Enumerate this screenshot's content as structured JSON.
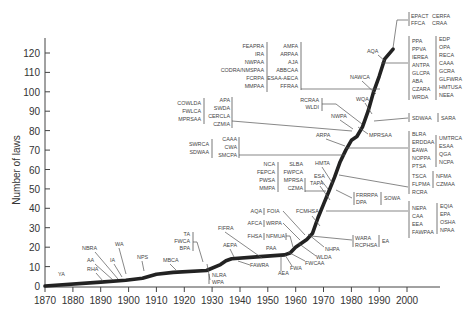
{
  "chart_data": {
    "type": "line",
    "title": "",
    "xlabel": "",
    "ylabel": "Number of laws",
    "xlim": [
      1870,
      2005
    ],
    "ylim": [
      0,
      125
    ],
    "x_ticks": [
      1870,
      1880,
      1890,
      1900,
      1910,
      1920,
      1930,
      1940,
      1950,
      1960,
      1970,
      1980,
      1990,
      2000
    ],
    "y_ticks": [
      0,
      10,
      20,
      30,
      40,
      50,
      60,
      70,
      80,
      90,
      100,
      110,
      120
    ],
    "grid": false,
    "legend": null,
    "series": [
      {
        "name": "Cumulative number of laws",
        "x": [
          1870,
          1890,
          1899,
          1905,
          1910,
          1916,
          1928,
          1933,
          1935,
          1937,
          1946,
          1956,
          1958,
          1960,
          1964,
          1966,
          1968,
          1970,
          1972,
          1974,
          1976,
          1978,
          1980,
          1982,
          1984,
          1986,
          1988,
          1990,
          1992,
          1995
        ],
        "values": [
          0,
          2,
          3,
          4,
          6,
          7,
          8,
          11,
          13,
          14,
          15,
          16,
          17,
          20,
          24,
          27,
          35,
          42,
          49,
          56,
          64,
          70,
          75,
          77,
          82,
          90,
          100,
          108,
          117,
          122
        ]
      }
    ],
    "annotations": [
      {
        "labels": [
          "YA"
        ]
      },
      {
        "labels": [
          "RHA"
        ]
      },
      {
        "labels": [
          "AA"
        ]
      },
      {
        "labels": [
          "NBRA"
        ]
      },
      {
        "labels": [
          "IA"
        ]
      },
      {
        "labels": [
          "WA"
        ]
      },
      {
        "labels": [
          "NPS"
        ]
      },
      {
        "labels": [
          "MBCA"
        ]
      },
      {
        "labels": [
          "TA",
          "FWCA",
          "BPA"
        ]
      },
      {
        "labels": [
          "NLRA",
          "WPA"
        ]
      },
      {
        "labels": [
          "FIFRA"
        ]
      },
      {
        "labels": [
          "AEPA"
        ]
      },
      {
        "labels": [
          "FAWRA"
        ]
      },
      {
        "labels": [
          "AEA"
        ]
      },
      {
        "labels": [
          "FWA"
        ]
      },
      {
        "labels": [
          "PAA"
        ]
      },
      {
        "labels": [
          "FWCAA"
        ]
      },
      {
        "labels": [
          "FHSA",
          "NFMUA"
        ]
      },
      {
        "labels": [
          "WLDA"
        ]
      },
      {
        "labels": [
          "AFCA",
          "WRPA"
        ]
      },
      {
        "labels": [
          "NHPA"
        ]
      },
      {
        "labels": [
          "AQA",
          "FOIA"
        ]
      },
      {
        "labels": [
          "FCMHSA"
        ]
      },
      {
        "labels": [
          "WARA",
          "RCPHSA",
          "EA"
        ]
      },
      {
        "labels": [
          "NEPA",
          "CAA",
          "EEA",
          "FAWPAA",
          "EQIA",
          "EPA",
          "OSHA",
          "NPAA"
        ]
      },
      {
        "labels": [
          "NCA",
          "FEPCA",
          "PWSA",
          "MMPA",
          "SLBA",
          "FWPCA",
          "MPRSA",
          "CZMA"
        ]
      },
      {
        "labels": [
          "ESA"
        ]
      },
      {
        "labels": [
          "TAPA"
        ]
      },
      {
        "labels": [
          "HMTA"
        ]
      },
      {
        "labels": [
          "FRRRPA",
          "DPA",
          "SOWA"
        ]
      },
      {
        "labels": [
          "TSCA",
          "FLPMA",
          "RCRA",
          "NFMA",
          "CZMAA"
        ]
      },
      {
        "labels": [
          "SWRCA",
          "SDWAA",
          "CAAA",
          "CWA",
          "SMCPA"
        ]
      },
      {
        "labels": [
          "ARPA"
        ]
      },
      {
        "labels": [
          "BLRA",
          "ERDDAA",
          "EAWA",
          "NOPPA",
          "PTSA",
          "UMTRCA",
          "ESAA",
          "QGA",
          "NCPA"
        ]
      },
      {
        "labels": [
          "COWLDA",
          "FWLCA",
          "MPRSAA",
          "APA",
          "SWDA",
          "CERCLA",
          "CZMIA"
        ]
      },
      {
        "labels": [
          "NWPA"
        ]
      },
      {
        "labels": [
          "MPRSAA"
        ]
      },
      {
        "labels": [
          "RCRAA",
          "WLDI"
        ]
      },
      {
        "labels": [
          "WQA"
        ]
      },
      {
        "labels": [
          "SDWAA",
          "SARA"
        ]
      },
      {
        "labels": [
          "FEAPRA",
          "IRA",
          "NWPAA",
          "CODRA/NMSPAA",
          "FCRPA",
          "MMPAA",
          "AMFA",
          "ARPAA",
          "AJA",
          "ABBCAA",
          "ESAA-AECA",
          "FFRAA"
        ]
      },
      {
        "labels": [
          "NAWCA"
        ]
      },
      {
        "labels": [
          "PPA",
          "PPVA",
          "IEREA",
          "ANTPA",
          "GLCPA",
          "ABA",
          "CZARA",
          "WRDA",
          "EDP",
          "OPA",
          "RECA",
          "CAAA",
          "GCRA",
          "GLFWRA",
          "HMTUSA",
          "NEEA"
        ]
      },
      {
        "labels": [
          "AQA"
        ]
      },
      {
        "labels": [
          "EPACT",
          "FFCA",
          "CERFA",
          "CRAA"
        ]
      }
    ]
  },
  "labels": {
    "ylabel": "Number of laws",
    "x_ticks": [
      "1870",
      "1880",
      "1890",
      "1900",
      "1910",
      "1920",
      "1930",
      "1940",
      "1950",
      "1960",
      "1970",
      "1980",
      "1990",
      "2000"
    ],
    "y_ticks": [
      "0",
      "10",
      "20",
      "30",
      "40",
      "50",
      "60",
      "70",
      "80",
      "90",
      "100",
      "110",
      "120"
    ],
    "a": {
      "ya": "YA",
      "rha": "RHA",
      "aa": "AA",
      "nbra": "NBRA",
      "ia": "IA",
      "wa": "WA",
      "nps": "NPS",
      "mbca": "MBCA",
      "ta": "TA",
      "fwca": "FWCA",
      "bpa": "BPA",
      "nlra": "NLRA",
      "wpa": "WPA",
      "fifra": "FIFRA",
      "aepa": "AEPA",
      "fawra": "FAWRA",
      "aea": "AEA",
      "fwa": "FWA",
      "paa": "PAA",
      "fwcaa": "FWCAA",
      "fhsa": "FHSA",
      "nfmua": "NFMUA",
      "wlda": "WLDA",
      "afca": "AFCA",
      "wrpa": "WRPA",
      "nhpa": "NHPA",
      "aqa1": "AQA",
      "foia": "FOIA",
      "fcmhsa": "FCMHSA",
      "wara": "WARA",
      "rcphsa": "RCPHSA",
      "ea": "EA",
      "nepa": "NEPA",
      "caa": "CAA",
      "eea": "EEA",
      "fawpaa": "FAWPAA",
      "eqia": "EQIA",
      "epa": "EPA",
      "osha": "OSHA",
      "npaa": "NPAA",
      "nca": "NCA",
      "fepca": "FEPCA",
      "pwsa": "PWSA",
      "mmpa": "MMPA",
      "slba": "SLBA",
      "fwpca": "FWPCA",
      "mprsa": "MPRSA",
      "czma": "CZMA",
      "esa": "ESA",
      "tapa": "TAPA",
      "hmta": "HMTA",
      "frrrpa": "FRRRPA",
      "dpa": "DPA",
      "sowa": "SOWA",
      "tsca": "TSCA",
      "flpma": "FLPMA",
      "rcra": "RCRA",
      "nfma": "NFMA",
      "czmaa": "CZMAA",
      "swrca": "SWRCA",
      "sdwaa1": "SDWAA",
      "caaa1": "CAAA",
      "cwa": "CWA",
      "smcpa": "SMCPA",
      "arpa": "ARPA",
      "blra": "BLRA",
      "erddaa": "ERDDAA",
      "eawa": "EAWA",
      "noppa": "NOPPA",
      "ptsa": "PTSA",
      "umtrca": "UMTRCA",
      "esaa": "ESAA",
      "qga": "QGA",
      "ncpa": "NCPA",
      "cowlda": "COWLDA",
      "fwlca": "FWLCA",
      "mprsaa1": "MPRSAA",
      "apa": "APA",
      "swda": "SWDA",
      "cercla": "CERCLA",
      "czmia": "CZMIA",
      "nwpa": "NWPA",
      "mprsaa2": "MPRSAA",
      "rcraa": "RCRAA",
      "wldi": "WLDI",
      "wqa": "WQA",
      "sdwaa2": "SDWAA",
      "sara": "SARA",
      "feapra": "FEAPRA",
      "ira": "IRA",
      "nwpaa": "NWPAA",
      "codra": "CODRA/NMSPAA",
      "fcrpa": "FCRPA",
      "mmpaa": "MMPAA",
      "amfa": "AMFA",
      "arpaa": "ARPAA",
      "aja": "AJA",
      "abbcaa": "ABBCAA",
      "esaaaeca": "ESAA-AECA",
      "ffraa": "FFRAA",
      "nawca": "NAWCA",
      "ppa": "PPA",
      "ppva": "PPVA",
      "ierea": "IEREA",
      "antpa": "ANTPA",
      "glcpa": "GLCPA",
      "aba": "ABA",
      "czara": "CZARA",
      "wrda": "WRDA",
      "edp": "EDP",
      "opa": "OPA",
      "reca": "RECA",
      "caaa2": "CAAA",
      "gcra": "GCRA",
      "glfwra": "GLFWRA",
      "hmtusa": "HMTUSA",
      "neea": "NEEA",
      "aqa2": "AQA",
      "epact": "EPACT",
      "ffca": "FFCA",
      "cerfa": "CERFA",
      "craa": "CRAA"
    }
  }
}
